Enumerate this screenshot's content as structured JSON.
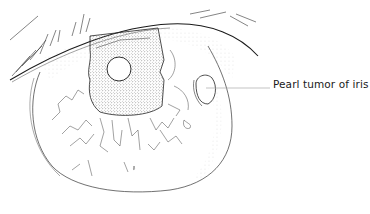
{
  "figure": {
    "annotations": [
      {
        "label": "Pearl tumor of iris",
        "target": "pearl-tumor"
      }
    ]
  },
  "colors": {
    "background": "#ffffff",
    "line": "#2a2a2a",
    "stipple": "#8a8a8a",
    "leader_line": "#9a9a9a"
  }
}
